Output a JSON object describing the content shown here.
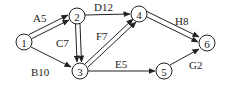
{
  "diagram": {
    "type": "directed-network",
    "nodes": [
      {
        "id": "1",
        "label": "1",
        "x": 24,
        "y": 42
      },
      {
        "id": "2",
        "label": "2",
        "x": 77,
        "y": 16
      },
      {
        "id": "3",
        "label": "3",
        "x": 80,
        "y": 71
      },
      {
        "id": "4",
        "label": "4",
        "x": 139,
        "y": 14
      },
      {
        "id": "5",
        "label": "5",
        "x": 164,
        "y": 71
      },
      {
        "id": "6",
        "label": "6",
        "x": 207,
        "y": 43
      }
    ],
    "edges": [
      {
        "from": "1",
        "to": "2",
        "label": "A5",
        "double": true
      },
      {
        "from": "1",
        "to": "3",
        "label": "B10",
        "double": false
      },
      {
        "from": "2",
        "to": "3",
        "label": "C7",
        "double": true
      },
      {
        "from": "2",
        "to": "4",
        "label": "D12",
        "double": false
      },
      {
        "from": "3",
        "to": "5",
        "label": "E5",
        "double": false
      },
      {
        "from": "3",
        "to": "4",
        "label": "F7",
        "double": true
      },
      {
        "from": "5",
        "to": "6",
        "label": "G2",
        "double": false
      },
      {
        "from": "4",
        "to": "6",
        "label": "H8",
        "double": true
      }
    ]
  },
  "labels": {
    "A5": "A5",
    "B10": "B10",
    "C7": "C7",
    "D12": "D12",
    "E5": "E5",
    "F7": "F7",
    "G2": "G2",
    "H8": "H8",
    "n1": "1",
    "n2": "2",
    "n3": "3",
    "n4": "4",
    "n5": "5",
    "n6": "6"
  }
}
